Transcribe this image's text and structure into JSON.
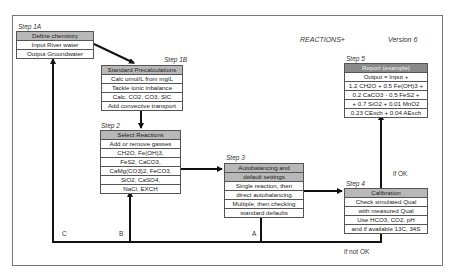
{
  "header": {
    "title": "REACTIONS+",
    "version": "Version 6"
  },
  "steps": {
    "step1a": {
      "label": "Step 1A",
      "header": "Define chemistry",
      "rows": [
        "Input River water",
        "Output Groundwater"
      ]
    },
    "step1b": {
      "label": "Step 1B",
      "header": "Standard Precalculations",
      "rows": [
        "Calc umol/L from mg/L",
        "Tackle ionic inbalance",
        "Calc. CO2, CO3, SIC",
        "Add convective transport"
      ]
    },
    "step2": {
      "label": "Step 2",
      "header": "Select Reactions",
      "rows": [
        "Add or remove gasses",
        "CH2O, Fe(OH)3,",
        "FeS2, CaCO3,",
        "CaMg(CO3)2, FeCO3,",
        "SiO2, CaSO4,",
        "NaCl, EXCH"
      ]
    },
    "step3": {
      "label": "Step 3",
      "header_lines": [
        "Autobalancing and",
        "default settings"
      ],
      "rows": [
        "Single reaction, then",
        "direct autobalancing",
        "Multiple, then checking",
        "standard defaults"
      ]
    },
    "step4": {
      "label": "Step 4",
      "header": "Calibration",
      "rows": [
        "Check simulated Qual",
        "with measured Qual",
        "Use HCO3, CO2, pH",
        "and if available 13C, 34S"
      ]
    },
    "step5": {
      "label": "Step 5",
      "header": "Report (example)",
      "rows": [
        "Output = Input +",
        "1.2 CH2O + 0.5 Fe(OH)3 +",
        "0.2 CaCO3 - 0.5 FeS2 +",
        "+ 0.7 SiO2 + 0.01 MnO2",
        "0.23 CExch + 0.04 AExch"
      ]
    }
  },
  "connectors": {
    "if_ok": "if OK",
    "if_not_ok": "if not OK",
    "loop_a": "A",
    "loop_b": "B",
    "loop_c": "C"
  },
  "colors": {
    "header_light": "#b8b8b8",
    "header_dark": "#8a8a8a",
    "line": "#111111",
    "frame": "#777777"
  }
}
